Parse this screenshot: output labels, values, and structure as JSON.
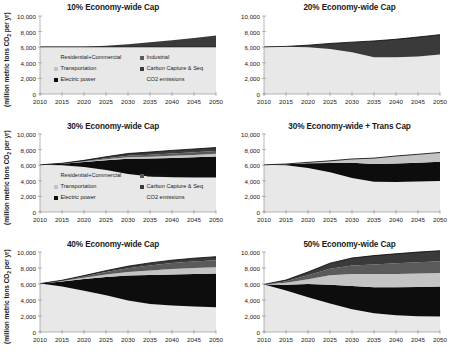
{
  "figure": {
    "yaxis_label": "(million metric tons CO",
    "yaxis_label_sub": "2",
    "yaxis_label_tail": " per yr)",
    "y_ticks": [
      "10,000",
      "8,000",
      "6,000",
      "4,000",
      "2,000",
      "0"
    ],
    "x_ticks": [
      "2010",
      "2015",
      "2020",
      "2025",
      "2030",
      "2035",
      "2040",
      "2045",
      "2050"
    ],
    "legend_items": [
      {
        "label": "Residential+Commercial",
        "color": "#e8e8e8",
        "marker": "none"
      },
      {
        "label": "Industrial",
        "color": "#5a5a5a",
        "marker": "square"
      },
      {
        "label": "Transportation",
        "color": "#c4c4c4",
        "marker": "square"
      },
      {
        "label": "Carbon Capture & Seq",
        "color": "#3a3a3a",
        "marker": "square"
      },
      {
        "label": "Electric power",
        "color": "#0d0d0d",
        "marker": "square"
      },
      {
        "label": "CO2 emissions",
        "color": "#000000",
        "marker": "none"
      }
    ]
  },
  "chart_data": [
    {
      "type": "area",
      "id": "cap10",
      "title": "10% Economy-wide Cap",
      "xlabel": "",
      "ylabel": "(million metric tons CO2 per yr)",
      "xlim": [
        2010,
        2050
      ],
      "ylim": [
        0,
        10000
      ],
      "grid": false,
      "legend_position": "inside-center",
      "x": [
        2010,
        2015,
        2020,
        2025,
        2030,
        2035,
        2040,
        2045,
        2050
      ],
      "series": [
        {
          "name": "Residential+Commercial",
          "values": [
            6050,
            6050,
            6050,
            6050,
            6050,
            6050,
            6050,
            6050,
            6050
          ]
        },
        {
          "name": "Electric power",
          "values": [
            0,
            0,
            0,
            0,
            0,
            0,
            0,
            0,
            0
          ]
        },
        {
          "name": "Transportation",
          "values": [
            0,
            0,
            0,
            0,
            0,
            0,
            0,
            0,
            0
          ]
        },
        {
          "name": "Industrial",
          "values": [
            0,
            0,
            0,
            0,
            0,
            0,
            0,
            0,
            0
          ]
        },
        {
          "name": "Carbon Capture & Seq",
          "values": [
            0,
            0,
            0,
            130,
            330,
            570,
            830,
            1120,
            1450
          ]
        }
      ],
      "co2_emissions": [
        6050,
        6050,
        6050,
        6050,
        6050,
        6050,
        6050,
        6050,
        6050
      ]
    },
    {
      "type": "area",
      "id": "cap20",
      "title": "20% Economy-wide Cap",
      "xlabel": "",
      "ylabel": "",
      "xlim": [
        2010,
        2050
      ],
      "ylim": [
        0,
        10000
      ],
      "grid": false,
      "legend_position": "none",
      "x": [
        2010,
        2015,
        2020,
        2025,
        2030,
        2035,
        2040,
        2045,
        2050
      ],
      "series": [
        {
          "name": "Residential+Commercial",
          "values": [
            6050,
            6050,
            5980,
            5780,
            5350,
            4720,
            4700,
            4820,
            5080
          ]
        },
        {
          "name": "Electric power",
          "values": [
            0,
            0,
            0,
            0,
            0,
            0,
            0,
            0,
            0
          ]
        },
        {
          "name": "Transportation",
          "values": [
            0,
            0,
            0,
            0,
            0,
            0,
            0,
            0,
            0
          ]
        },
        {
          "name": "Industrial",
          "values": [
            0,
            0,
            0,
            0,
            0,
            0,
            0,
            0,
            0
          ]
        },
        {
          "name": "Carbon Capture & Seq",
          "values": [
            0,
            50,
            280,
            700,
            1300,
            2080,
            2320,
            2480,
            2530
          ]
        }
      ],
      "co2_emissions": [
        6050,
        6100,
        6260,
        6480,
        6650,
        6800,
        7020,
        7300,
        7610
      ]
    },
    {
      "type": "area",
      "id": "cap30",
      "title": "30% Economy-wide Cap",
      "xlabel": "",
      "ylabel": "(million metric tons CO2 per yr)",
      "xlim": [
        2010,
        2050
      ],
      "ylim": [
        0,
        10000
      ],
      "grid": false,
      "legend_position": "inside-center",
      "x": [
        2010,
        2015,
        2020,
        2025,
        2030,
        2035,
        2040,
        2045,
        2050
      ],
      "series": [
        {
          "name": "Residential+Commercial",
          "values": [
            6050,
            5980,
            5780,
            5400,
            4880,
            4550,
            4450,
            4420,
            4430
          ]
        },
        {
          "name": "Electric power",
          "values": [
            0,
            200,
            620,
            1230,
            1950,
            2300,
            2480,
            2600,
            2700
          ]
        },
        {
          "name": "Transportation",
          "values": [
            0,
            20,
            60,
            120,
            180,
            230,
            270,
            300,
            330
          ]
        },
        {
          "name": "Industrial",
          "values": [
            0,
            20,
            60,
            130,
            200,
            260,
            300,
            330,
            350
          ]
        },
        {
          "name": "Carbon Capture & Seq",
          "values": [
            0,
            30,
            100,
            200,
            290,
            350,
            400,
            430,
            450
          ]
        }
      ],
      "co2_emissions": [
        6050,
        6250,
        6620,
        7080,
        7500,
        7690,
        7900,
        8080,
        8260
      ]
    },
    {
      "type": "area",
      "id": "cap30trans",
      "title": "30% Economy-wide + Trans Cap",
      "xlabel": "",
      "ylabel": "",
      "xlim": [
        2010,
        2050
      ],
      "ylim": [
        0,
        10000
      ],
      "grid": false,
      "legend_position": "none",
      "x": [
        2010,
        2015,
        2020,
        2025,
        2030,
        2035,
        2040,
        2045,
        2050
      ],
      "series": [
        {
          "name": "Residential+Commercial",
          "values": [
            6050,
            6000,
            5650,
            5100,
            4350,
            3880,
            3850,
            3900,
            3980
          ]
        },
        {
          "name": "Electric power",
          "values": [
            0,
            120,
            600,
            1180,
            1950,
            2280,
            2380,
            2420,
            2450
          ]
        },
        {
          "name": "Transportation",
          "values": [
            0,
            30,
            120,
            280,
            500,
            750,
            950,
            1080,
            1200
          ]
        },
        {
          "name": "Industrial",
          "values": [
            0,
            0,
            0,
            0,
            0,
            0,
            0,
            0,
            0
          ]
        },
        {
          "name": "Carbon Capture & Seq",
          "values": [
            0,
            0,
            0,
            0,
            0,
            0,
            0,
            0,
            0
          ]
        }
      ],
      "co2_emissions": [
        6050,
        6150,
        6370,
        6560,
        6800,
        6910,
        7180,
        7400,
        7630
      ]
    },
    {
      "type": "area",
      "id": "cap40",
      "title": "40% Economy-wide Cap",
      "xlabel": "",
      "ylabel": "(million metric tons CO2 per yr)",
      "xlim": [
        2010,
        2050
      ],
      "ylim": [
        0,
        10000
      ],
      "grid": false,
      "legend_position": "none",
      "x": [
        2010,
        2015,
        2020,
        2025,
        2030,
        2035,
        2040,
        2045,
        2050
      ],
      "series": [
        {
          "name": "Residential+Commercial",
          "values": [
            6050,
            5700,
            5150,
            4580,
            3950,
            3500,
            3300,
            3180,
            3100
          ]
        },
        {
          "name": "Electric power",
          "values": [
            0,
            620,
            1480,
            2300,
            3100,
            3620,
            3900,
            4080,
            4200
          ]
        },
        {
          "name": "Transportation",
          "values": [
            0,
            60,
            160,
            300,
            450,
            580,
            680,
            750,
            800
          ]
        },
        {
          "name": "Industrial",
          "values": [
            0,
            60,
            170,
            320,
            480,
            620,
            730,
            810,
            870
          ]
        },
        {
          "name": "Carbon Capture & Seq",
          "values": [
            0,
            30,
            90,
            170,
            250,
            320,
            370,
            410,
            440
          ]
        }
      ],
      "co2_emissions": [
        6050,
        6470,
        7050,
        7670,
        8230,
        8640,
        8980,
        9230,
        9410
      ]
    },
    {
      "type": "area",
      "id": "cap50",
      "title": "50% Economy-wide Cap",
      "xlabel": "",
      "ylabel": "",
      "xlim": [
        2010,
        2050
      ],
      "ylim": [
        0,
        10000
      ],
      "grid": false,
      "legend_position": "none",
      "x": [
        2010,
        2015,
        2020,
        2025,
        2030,
        2035,
        2040,
        2045,
        2050
      ],
      "series": [
        {
          "name": "Residential+Commercial",
          "values": [
            5950,
            5200,
            4350,
            3550,
            2850,
            2350,
            2080,
            1980,
            1950
          ]
        },
        {
          "name": "Electric power",
          "values": [
            0,
            700,
            1650,
            2350,
            2900,
            3250,
            3500,
            3650,
            3750
          ]
        },
        {
          "name": "Transportation",
          "values": [
            0,
            250,
            600,
            1180,
            1500,
            1650,
            1680,
            1680,
            1680
          ]
        },
        {
          "name": "Industrial",
          "values": [
            0,
            200,
            500,
            820,
            1050,
            1200,
            1320,
            1400,
            1450
          ]
        },
        {
          "name": "Carbon Capture & Seq",
          "values": [
            0,
            150,
            400,
            700,
            950,
            1100,
            1200,
            1280,
            1330
          ]
        }
      ],
      "co2_emissions": [
        5950,
        6500,
        7500,
        8600,
        9250,
        9550,
        9780,
        9990,
        10160
      ]
    }
  ]
}
